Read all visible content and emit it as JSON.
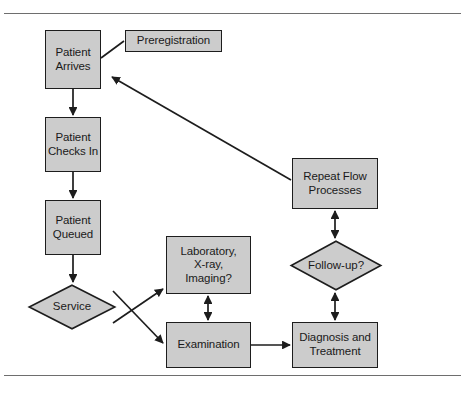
{
  "figure": {
    "background_color": "#ffffff",
    "node_fill": "#cccccc",
    "node_stroke": "#1d1d1d",
    "edge_color": "#1d1d1d",
    "rule_color": "#6e6e6e"
  },
  "nodes": [
    {
      "id": "patient-arrives",
      "label": "Patient\nArrives",
      "shape": "box",
      "x": 45,
      "y": 30,
      "w": 56,
      "h": 59,
      "font_size": 11.5
    },
    {
      "id": "preregistration",
      "label": "Preregistration",
      "shape": "box",
      "x": 125,
      "y": 30,
      "w": 97,
      "h": 22,
      "font_size": 11.5
    },
    {
      "id": "patient-checks-in",
      "label": "Patient\nChecks In",
      "shape": "box",
      "x": 45,
      "y": 117,
      "w": 56,
      "h": 55,
      "font_size": 11.5
    },
    {
      "id": "patient-queued",
      "label": "Patient\nQueued",
      "shape": "box",
      "x": 45,
      "y": 200,
      "w": 56,
      "h": 55,
      "font_size": 11.5
    },
    {
      "id": "service",
      "label": "Service",
      "shape": "diamond",
      "x": 28,
      "y": 284,
      "w": 88,
      "h": 46,
      "font_size": 11.5
    },
    {
      "id": "laboratory",
      "label": "Laboratory,\nX-ray,\nImaging?",
      "shape": "box",
      "x": 166,
      "y": 236,
      "w": 85,
      "h": 58,
      "font_size": 11.5
    },
    {
      "id": "examination",
      "label": "Examination",
      "shape": "box",
      "x": 166,
      "y": 322,
      "w": 85,
      "h": 46,
      "font_size": 11.5
    },
    {
      "id": "repeat-flow",
      "label": "Repeat Flow\nProcesses",
      "shape": "box",
      "x": 292,
      "y": 158,
      "w": 86,
      "h": 51,
      "font_size": 11.5
    },
    {
      "id": "follow-up",
      "label": "Follow-up?",
      "shape": "diamond",
      "x": 290,
      "y": 240,
      "w": 92,
      "h": 51,
      "font_size": 11.5
    },
    {
      "id": "diagnosis",
      "label": "Diagnosis and\nTreatment",
      "shape": "box",
      "x": 292,
      "y": 322,
      "w": 86,
      "h": 46,
      "font_size": 11.5
    }
  ],
  "edges": [
    {
      "id": "preregistration-to-patient-arrives",
      "from": "preregistration",
      "to": "patient-arrives",
      "arrow": "none",
      "points": "124,41 101,58"
    },
    {
      "id": "patient-arrives-to-checks-in",
      "from": "patient-arrives",
      "to": "patient-checks-in",
      "arrow": "end",
      "points": "73,89 73,115"
    },
    {
      "id": "checks-in-to-queued",
      "from": "patient-checks-in",
      "to": "patient-queued",
      "arrow": "end",
      "points": "73,172 73,198"
    },
    {
      "id": "queued-to-service",
      "from": "patient-queued",
      "to": "service",
      "arrow": "end",
      "points": "73,255 73,282"
    },
    {
      "id": "service-to-laboratory",
      "from": "service",
      "to": "laboratory",
      "arrow": "end",
      "points": "113,323 163,289"
    },
    {
      "id": "service-to-examination",
      "from": "service",
      "to": "examination",
      "arrow": "end",
      "points": "113,291 163,343"
    },
    {
      "id": "laboratory-to-examination",
      "from": "laboratory",
      "to": "examination",
      "arrow": "both",
      "points": "208,296 208,320"
    },
    {
      "id": "examination-to-diagnosis",
      "from": "examination",
      "to": "diagnosis",
      "arrow": "end",
      "points": "251,345 290,345"
    },
    {
      "id": "diagnosis-to-follow-up",
      "from": "diagnosis",
      "to": "follow-up",
      "arrow": "both",
      "points": "335,320 335,293"
    },
    {
      "id": "follow-up-to-repeat-flow",
      "from": "follow-up",
      "to": "repeat-flow",
      "arrow": "both",
      "points": "335,238 335,211"
    },
    {
      "id": "repeat-flow-to-patient-arrives",
      "from": "repeat-flow",
      "to": "patient-arrives",
      "arrow": "end",
      "points": "291,180 112,77"
    }
  ]
}
